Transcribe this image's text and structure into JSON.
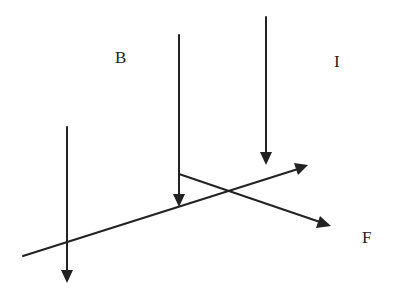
{
  "diagram": {
    "colors": {
      "stroke": "#222222",
      "background": "#ffffff"
    },
    "labels": {
      "field": "B",
      "current": "I",
      "force": "F"
    },
    "field_lines": [
      {
        "id": "left",
        "x": 67,
        "y1": 127,
        "y2": 282
      },
      {
        "id": "middle",
        "x": 179,
        "y1": 35,
        "y2": 206
      },
      {
        "id": "right",
        "x": 266,
        "y1": 17,
        "y2": 164
      }
    ],
    "current_wire": {
      "x1": 23,
      "y1": 256,
      "x2": 307,
      "y2": 166
    },
    "force_vector": {
      "x1": 179,
      "y1": 174,
      "x2": 330,
      "y2": 226
    }
  }
}
